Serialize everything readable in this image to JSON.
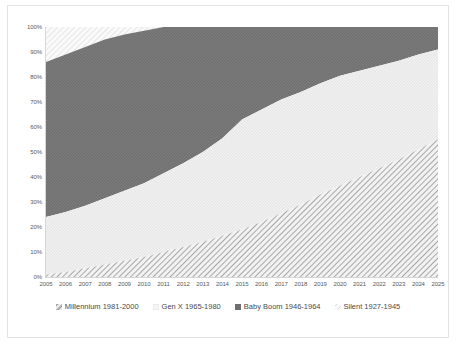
{
  "chart_data": {
    "type": "area",
    "title": "",
    "subtitle": "",
    "xlabel": "",
    "ylabel": "",
    "stacked": true,
    "stack_order_bottom_to_top": [
      "Millennium 1981-2000",
      "Gen X 1965-1980",
      "Baby Boom 1946-1964",
      "Silent 1927-1945"
    ],
    "grid": false,
    "legend_position": "bottom",
    "xlim": [
      2005,
      2025
    ],
    "ylim": [
      0,
      100
    ],
    "x": [
      2005,
      2006,
      2007,
      2008,
      2009,
      2010,
      2011,
      2012,
      2013,
      2014,
      2015,
      2016,
      2017,
      2018,
      2019,
      2020,
      2021,
      2022,
      2023,
      2024,
      2025
    ],
    "categories": [
      "2005",
      "2006",
      "2007",
      "2008",
      "2009",
      "2010",
      "2011",
      "2012",
      "2013",
      "2014",
      "2015",
      "2016",
      "2017",
      "2018",
      "2019",
      "2020",
      "2021",
      "2022",
      "2023",
      "2024",
      "2025"
    ],
    "ytick_labels": [
      "0%",
      "10%",
      "20%",
      "30%",
      "40%",
      "50%",
      "60%",
      "70%",
      "80%",
      "90%",
      "100%"
    ],
    "ytick_values": [
      0,
      10,
      20,
      30,
      40,
      50,
      60,
      70,
      80,
      90,
      100
    ],
    "series": [
      {
        "name": "Millennium 1981-2000",
        "pattern": "diagonal-hatch-medium",
        "color": "#b0b0b0",
        "values": [
          1,
          2,
          3.5,
          5,
          6.5,
          8,
          10,
          12,
          14,
          16.5,
          19,
          22,
          25.5,
          29,
          33,
          36.5,
          40,
          43.5,
          47,
          51,
          55
        ]
      },
      {
        "name": "Gen X 1965-1980",
        "pattern": "fine-dots-light",
        "color": "#ededed",
        "values": [
          23,
          24,
          25,
          26.5,
          28,
          29.5,
          31.5,
          33.5,
          36,
          39,
          44,
          45,
          45.5,
          45,
          44.5,
          44,
          42.5,
          41,
          39.5,
          38,
          36
        ]
      },
      {
        "name": "Baby Boom 1946-1964",
        "pattern": "fine-dots-dark",
        "color": "#6a6a6a",
        "values": [
          62,
          63,
          63.5,
          63.5,
          62.5,
          61,
          58.5,
          54.5,
          50,
          44.5,
          37,
          33,
          29,
          26,
          22.5,
          19.5,
          17.5,
          15.5,
          13.5,
          11,
          9
        ]
      },
      {
        "name": "Silent 1927-1945",
        "pattern": "diagonal-hatch-faint",
        "color": "#f0f0f0",
        "values": [
          14,
          11,
          8,
          5,
          3,
          1.5,
          0,
          0,
          0,
          0,
          0,
          0,
          0,
          0,
          0,
          0,
          0,
          0,
          0,
          0,
          0
        ]
      }
    ],
    "cumulative_tops": {
      "Millennium 1981-2000": [
        1,
        2,
        3.5,
        5,
        6.5,
        8,
        10,
        12,
        14,
        16.5,
        19,
        22,
        25.5,
        29,
        33,
        36.5,
        40,
        43.5,
        47,
        51,
        55
      ],
      "Gen X 1965-1980": [
        24,
        26,
        28.5,
        31.5,
        34.5,
        37.5,
        41.5,
        45.5,
        50,
        55.5,
        63,
        67,
        71,
        74,
        77.5,
        80.5,
        82.5,
        84.5,
        86.5,
        89,
        91
      ],
      "Baby Boom 1946-1964": [
        86,
        89,
        92,
        95,
        97,
        98.5,
        100,
        100,
        100,
        100,
        100,
        100,
        100,
        100,
        100,
        100,
        100,
        100,
        100,
        100,
        100
      ],
      "Silent 1927-1945": [
        100,
        100,
        100,
        100,
        100,
        100,
        100,
        100,
        100,
        100,
        100,
        100,
        100,
        100,
        100,
        100,
        100,
        100,
        100,
        100,
        100
      ]
    }
  },
  "legend": {
    "items": [
      {
        "label": "Millennium 1981-2000",
        "marker": "legend-swatch-millennium"
      },
      {
        "label": "Gen X 1965-1980",
        "marker": "legend-swatch-genx"
      },
      {
        "label": "Baby Boom 1946-1964",
        "marker": "legend-swatch-babyboom"
      },
      {
        "label": "Silent 1927-1945",
        "marker": "legend-swatch-silent"
      }
    ]
  },
  "axes": {
    "y_labels": [
      "100%",
      "90%",
      "80%",
      "70%",
      "60%",
      "50%",
      "40%",
      "30%",
      "20%",
      "10%",
      "0%"
    ],
    "x_labels": [
      "2005",
      "2006",
      "2007",
      "2008",
      "2009",
      "2010",
      "2011",
      "2012",
      "2013",
      "2014",
      "2015",
      "2016",
      "2017",
      "2018",
      "2019",
      "2020",
      "2021",
      "2022",
      "2023",
      "2024",
      "2025"
    ]
  },
  "colors": {
    "millennium": "#b0b0b0",
    "genx": "#ededed",
    "babyboom": "#6a6a6a",
    "silent": "#f0f0f0",
    "axis": "#d6d6d6",
    "text": "#595959",
    "frame": "#e3e3e3"
  }
}
